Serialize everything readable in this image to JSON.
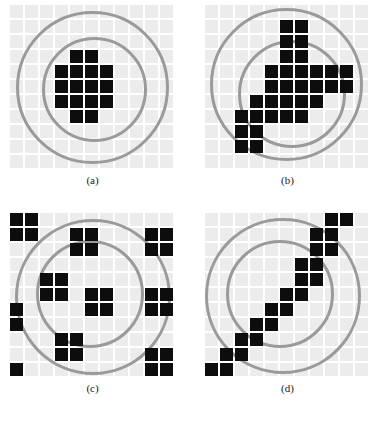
{
  "figure": {
    "grid": {
      "cols": 11,
      "rows": 11,
      "cell_size": 15,
      "gap": 2,
      "tile_color": "#ececec",
      "fill_color": "#0d0d0d",
      "ring_color": "#9a9a9a",
      "background": "#ffffff"
    },
    "panels": [
      {
        "id": "a",
        "caption": "(a)",
        "origin": [
          10,
          5
        ],
        "rings": [
          {
            "name": "outer-circle",
            "cx": 5.5,
            "cy": 5.5,
            "r": 5.1
          },
          {
            "name": "inner-circle",
            "cx": 5.6,
            "cy": 5.6,
            "r": 3.5
          }
        ],
        "filled_cells": [
          [
            4,
            3
          ],
          [
            5,
            3
          ],
          [
            3,
            4
          ],
          [
            4,
            4
          ],
          [
            5,
            4
          ],
          [
            6,
            4
          ],
          [
            3,
            5
          ],
          [
            4,
            5
          ],
          [
            5,
            5
          ],
          [
            6,
            5
          ],
          [
            3,
            6
          ],
          [
            4,
            6
          ],
          [
            5,
            6
          ],
          [
            6,
            6
          ],
          [
            4,
            7
          ],
          [
            5,
            7
          ]
        ]
      },
      {
        "id": "b",
        "caption": "(b)",
        "origin": [
          205,
          5
        ],
        "rings": [
          {
            "name": "outer-circle",
            "cx": 5.4,
            "cy": 5.3,
            "r": 5.1
          },
          {
            "name": "inner-circle",
            "cx": 5.8,
            "cy": 5.9,
            "r": 3.6
          }
        ],
        "filled_cells": [
          [
            5,
            1
          ],
          [
            6,
            1
          ],
          [
            5,
            2
          ],
          [
            6,
            2
          ],
          [
            5,
            3
          ],
          [
            6,
            3
          ],
          [
            4,
            4
          ],
          [
            5,
            4
          ],
          [
            6,
            4
          ],
          [
            7,
            4
          ],
          [
            8,
            4
          ],
          [
            9,
            4
          ],
          [
            4,
            5
          ],
          [
            5,
            5
          ],
          [
            6,
            5
          ],
          [
            7,
            5
          ],
          [
            8,
            5
          ],
          [
            9,
            5
          ],
          [
            3,
            6
          ],
          [
            4,
            6
          ],
          [
            5,
            6
          ],
          [
            6,
            6
          ],
          [
            7,
            6
          ],
          [
            2,
            7
          ],
          [
            3,
            7
          ],
          [
            4,
            7
          ],
          [
            5,
            7
          ],
          [
            6,
            7
          ],
          [
            2,
            8
          ],
          [
            3,
            8
          ],
          [
            2,
            9
          ],
          [
            3,
            9
          ]
        ]
      },
      {
        "id": "c",
        "caption": "(c)",
        "origin": [
          10,
          213
        ],
        "rings": [
          {
            "name": "outer-circle",
            "cx": 5.5,
            "cy": 5.6,
            "r": 5.2
          },
          {
            "name": "inner-circle",
            "cx": 5.3,
            "cy": 5.4,
            "r": 3.6
          }
        ],
        "filled_cells": [
          [
            0,
            0
          ],
          [
            1,
            0
          ],
          [
            0,
            1
          ],
          [
            1,
            1
          ],
          [
            4,
            1
          ],
          [
            5,
            1
          ],
          [
            9,
            1
          ],
          [
            10,
            1
          ],
          [
            4,
            2
          ],
          [
            5,
            2
          ],
          [
            9,
            2
          ],
          [
            10,
            2
          ],
          [
            2,
            4
          ],
          [
            3,
            4
          ],
          [
            2,
            5
          ],
          [
            3,
            5
          ],
          [
            5,
            5
          ],
          [
            6,
            5
          ],
          [
            9,
            5
          ],
          [
            10,
            5
          ],
          [
            5,
            6
          ],
          [
            6,
            6
          ],
          [
            9,
            6
          ],
          [
            10,
            6
          ],
          [
            0,
            6
          ],
          [
            0,
            7
          ],
          [
            3,
            8
          ],
          [
            4,
            8
          ],
          [
            3,
            9
          ],
          [
            4,
            9
          ],
          [
            9,
            9
          ],
          [
            10,
            9
          ],
          [
            0,
            10
          ],
          [
            9,
            10
          ],
          [
            10,
            10
          ]
        ]
      },
      {
        "id": "d",
        "caption": "(d)",
        "origin": [
          205,
          213
        ],
        "rings": [
          {
            "name": "outer-circle",
            "cx": 5.2,
            "cy": 5.5,
            "r": 5.2
          },
          {
            "name": "inner-circle",
            "cx": 5.0,
            "cy": 5.4,
            "r": 3.6
          }
        ],
        "filled_cells": [
          [
            8,
            0
          ],
          [
            9,
            0
          ],
          [
            7,
            1
          ],
          [
            8,
            1
          ],
          [
            7,
            2
          ],
          [
            8,
            2
          ],
          [
            6,
            3
          ],
          [
            7,
            3
          ],
          [
            6,
            4
          ],
          [
            7,
            4
          ],
          [
            5,
            5
          ],
          [
            6,
            5
          ],
          [
            4,
            6
          ],
          [
            5,
            6
          ],
          [
            3,
            7
          ],
          [
            4,
            7
          ],
          [
            2,
            8
          ],
          [
            3,
            8
          ],
          [
            1,
            9
          ],
          [
            2,
            9
          ],
          [
            0,
            10
          ],
          [
            1,
            10
          ]
        ]
      }
    ]
  }
}
